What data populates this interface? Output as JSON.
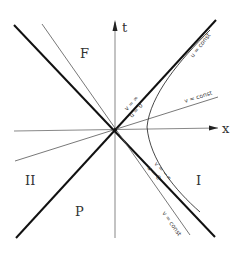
{
  "diagram": {
    "axes": {
      "time_label": "t",
      "space_label": "x"
    },
    "regions": {
      "future": "F",
      "past": "P",
      "right": "I",
      "left": "II"
    },
    "annotations": {
      "u_const": "u = const",
      "v_const_upper": "v = const",
      "v_const_lower": "v = const",
      "v_inf": "v = ∞",
      "u_zero_upper": "u = 0",
      "v_minus_inf": "v = −∞",
      "u_zero_lower": "u = 0"
    }
  }
}
